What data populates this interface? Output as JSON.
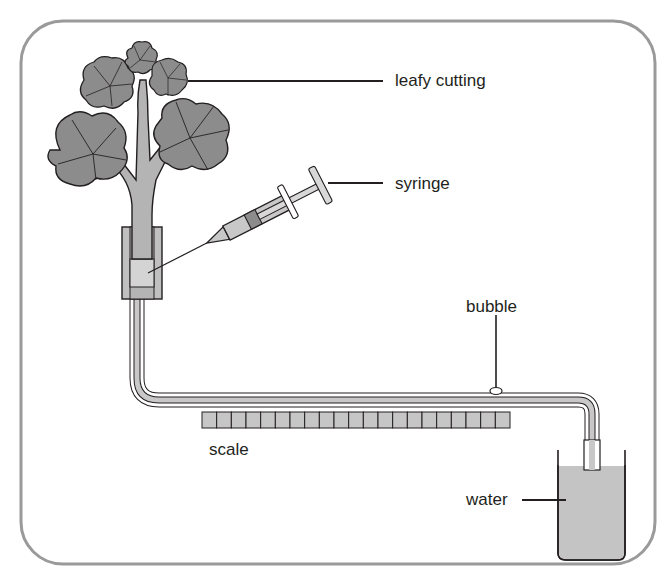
{
  "diagram": {
    "labels": {
      "leafy_cutting": "leafy cutting",
      "syringe": "syringe",
      "bubble": "bubble",
      "scale": "scale",
      "water": "water"
    },
    "scale": {
      "cell_count": 21
    },
    "colors": {
      "frame": "#9a9a9a",
      "leaf_fill": "#8c8c8c",
      "stem_fill": "#b4b4b4",
      "tube_fill": "#c8c8c8",
      "water_fill": "#c4c4c4",
      "scale_fill": "#c6c6c6",
      "outline": "#231f20"
    }
  }
}
